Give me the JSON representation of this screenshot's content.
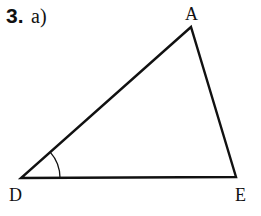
{
  "exercise": {
    "number": "3.",
    "part": "a)"
  },
  "diagram": {
    "type": "triangle",
    "vertices": [
      {
        "label": "A",
        "x": 191,
        "y": 27
      },
      {
        "label": "D",
        "x": 21,
        "y": 178
      },
      {
        "label": "E",
        "x": 236,
        "y": 177
      }
    ],
    "marked_angle": "D",
    "stroke_color": "#111111"
  }
}
